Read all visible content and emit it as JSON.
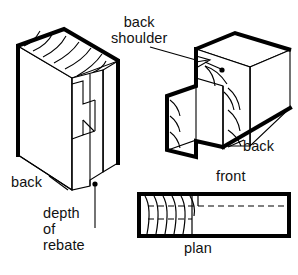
{
  "figure": {
    "type": "technical-woodworking-diagram",
    "background_color": "#ffffff",
    "line_color": "#000000",
    "views": [
      {
        "name": "left-isometric-view",
        "description": "Isometric view of rebated board showing back face and rebate depth"
      },
      {
        "name": "right-isometric-view",
        "description": "Isometric view of mating rail showing back shoulder"
      },
      {
        "name": "plan-view",
        "description": "Plan section through the joint with hidden detail in dashed lines"
      }
    ]
  },
  "labels": {
    "back_shoulder_line1": "back",
    "back_shoulder_line2": "shoulder",
    "back_left": "back",
    "depth_line1": "depth",
    "depth_line2": "of",
    "depth_line3": "rebate",
    "back_right": "back",
    "front": "front",
    "plan": "plan"
  }
}
